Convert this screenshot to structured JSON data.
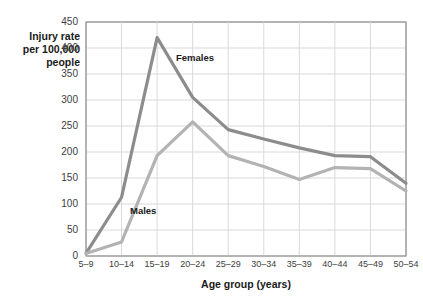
{
  "chart_data": {
    "type": "line",
    "title": "",
    "xlabel": "Age group (years)",
    "ylabel": "Injury rate\nper 100,000\npeople",
    "categories": [
      "5–9",
      "10–14",
      "15–19",
      "20–24",
      "25–29",
      "30–34",
      "35–39",
      "40–44",
      "45–49",
      "50–54"
    ],
    "ylim": [
      0,
      450
    ],
    "ytick_values": [
      0,
      50,
      100,
      150,
      200,
      250,
      300,
      350,
      400,
      450
    ],
    "ytick_labels": [
      "0",
      "50",
      "100",
      "150",
      "200",
      "250",
      "300",
      "350",
      "400",
      "450"
    ],
    "grid": true,
    "legend_position": "inline-annotation",
    "series": [
      {
        "name": "Females",
        "color": "#8c8c8c",
        "values": [
          5,
          113,
          420,
          305,
          243,
          225,
          208,
          193,
          191,
          140
        ]
      },
      {
        "name": "Males",
        "color": "#b3b3b3",
        "values": [
          5,
          27,
          193,
          258,
          193,
          172,
          147,
          170,
          168,
          125
        ]
      }
    ],
    "annotations": [
      {
        "text": "Females",
        "x_px": 176,
        "y_px": 52
      },
      {
        "text": "Males",
        "x_px": 130,
        "y_px": 205
      }
    ]
  },
  "style": {
    "plot_background": "#ffffff",
    "grid_color": "#d9d9d9",
    "axis_color": "#9a9a9a",
    "text_color": "#1a1a1a"
  }
}
